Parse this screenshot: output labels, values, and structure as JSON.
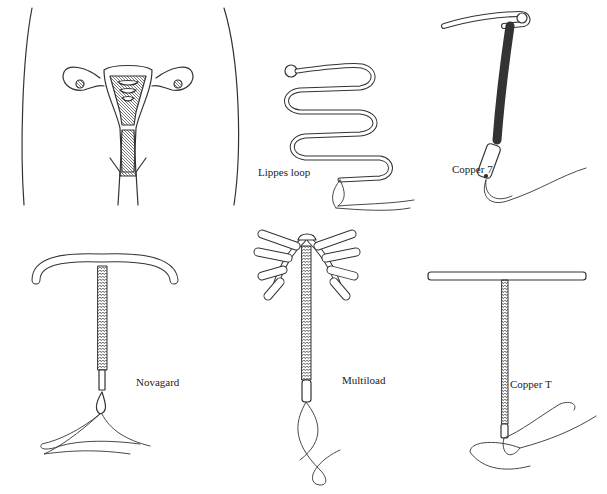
{
  "figure": {
    "panels": [
      {
        "id": "anatomy",
        "label": ""
      },
      {
        "id": "lippes-loop",
        "label": "Lippes loop"
      },
      {
        "id": "copper-7",
        "label": "Copper 7"
      },
      {
        "id": "novagard",
        "label": "Novagard"
      },
      {
        "id": "multiload",
        "label": "Multiload"
      },
      {
        "id": "copper-t",
        "label": "Copper T"
      }
    ]
  },
  "colors": {
    "ink": "#333333",
    "background": "#ffffff",
    "shade": "#777777"
  }
}
